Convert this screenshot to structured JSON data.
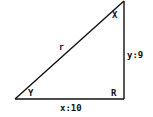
{
  "diagram": {
    "type": "right-triangle",
    "stroke_color": "#111111",
    "background": "#ffffff",
    "vertices": {
      "top": "X",
      "bottom_left": "Y",
      "right_angle": "R"
    },
    "labels": {
      "angle_top": "X",
      "angle_bottom_left": "Y",
      "angle_right": "R",
      "hypotenuse": "r",
      "vertical_side": "y:9",
      "horizontal_side": "x:10"
    }
  }
}
